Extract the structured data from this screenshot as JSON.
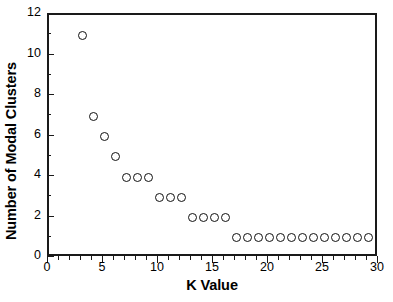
{
  "chart_data": {
    "type": "scatter",
    "title": "",
    "xlabel": "K Value",
    "ylabel": "Number of Modal Clusters",
    "xlim": [
      0,
      30
    ],
    "ylim": [
      0,
      12
    ],
    "grid": false,
    "legend": null,
    "x_ticks": [
      0,
      5,
      10,
      15,
      20,
      25,
      30
    ],
    "x_tick_labels": [
      "0",
      "5",
      "10",
      "15",
      "20",
      "25",
      "30"
    ],
    "x_minor_ticks": [
      1,
      2,
      3,
      4,
      6,
      7,
      8,
      9,
      11,
      12,
      13,
      14,
      16,
      17,
      18,
      19,
      21,
      22,
      23,
      24,
      26,
      27,
      28,
      29
    ],
    "y_ticks": [
      0,
      2,
      4,
      6,
      8,
      10,
      12
    ],
    "y_tick_labels": [
      "0",
      "2",
      "4",
      "6",
      "8",
      "10",
      "12"
    ],
    "y_minor_ticks": [
      1,
      3,
      5,
      7,
      9,
      11
    ],
    "marker": "open-circle",
    "marker_color": "#111111",
    "points": [
      {
        "x": 3,
        "y": 11
      },
      {
        "x": 4,
        "y": 7
      },
      {
        "x": 5,
        "y": 6
      },
      {
        "x": 6,
        "y": 5
      },
      {
        "x": 7,
        "y": 4
      },
      {
        "x": 8,
        "y": 4
      },
      {
        "x": 9,
        "y": 4
      },
      {
        "x": 10,
        "y": 3
      },
      {
        "x": 11,
        "y": 3
      },
      {
        "x": 12,
        "y": 3
      },
      {
        "x": 13,
        "y": 2
      },
      {
        "x": 14,
        "y": 2
      },
      {
        "x": 15,
        "y": 2
      },
      {
        "x": 16,
        "y": 2
      },
      {
        "x": 17,
        "y": 1
      },
      {
        "x": 18,
        "y": 1
      },
      {
        "x": 19,
        "y": 1
      },
      {
        "x": 20,
        "y": 1
      },
      {
        "x": 21,
        "y": 1
      },
      {
        "x": 22,
        "y": 1
      },
      {
        "x": 23,
        "y": 1
      },
      {
        "x": 24,
        "y": 1
      },
      {
        "x": 25,
        "y": 1
      },
      {
        "x": 26,
        "y": 1
      },
      {
        "x": 27,
        "y": 1
      },
      {
        "x": 28,
        "y": 1
      },
      {
        "x": 29,
        "y": 1
      }
    ]
  }
}
